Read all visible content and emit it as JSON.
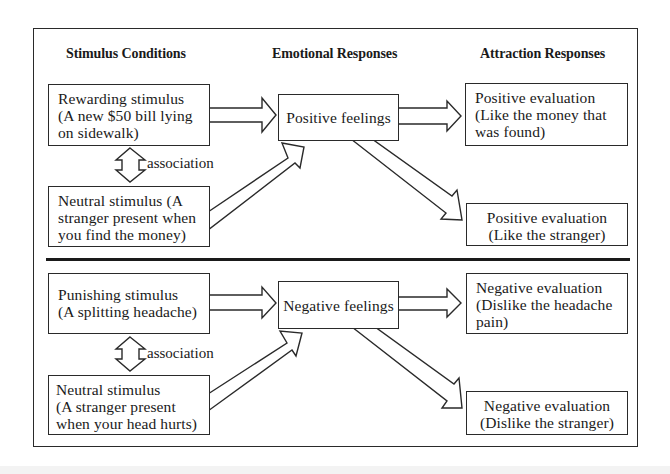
{
  "headers": {
    "stimulus": "Stimulus Conditions",
    "emotional": "Emotional Responses",
    "attraction": "Attraction Responses"
  },
  "positive_panel": {
    "stimulus_box": "Rewarding stimulus\n(A new $50 bill lying\non sidewalk)",
    "association_label": "association",
    "neutral_box": "Neutral stimulus  (A\nstranger present when\nyou find the money)",
    "feeling_box": "Positive feelings",
    "evaluation_stimulus_box": "Positive evaluation\n(Like the money that\nwas found)",
    "evaluation_stranger_box": "Positive evaluation\n(Like the stranger)"
  },
  "negative_panel": {
    "stimulus_box": "Punishing stimulus\n(A splitting headache)",
    "association_label": "association",
    "neutral_box": "Neutral stimulus\n(A stranger present\nwhen your head hurts)",
    "feeling_box": "Negative feelings",
    "evaluation_stimulus_box": "Negative evaluation\n(Dislike the headache\npain)",
    "evaluation_stranger_box": "Negative evaluation\n(Dislike the stranger)"
  },
  "icons": {
    "right_arrow": "block-arrow-right",
    "diagonal_up_arrow": "block-arrow-up-right",
    "diagonal_down_arrow": "block-arrow-down-right",
    "association_arrow": "double-headed-vertical-arrow"
  },
  "colors": {
    "line": "#2a2a2a",
    "text": "#1a1a1a",
    "background": "#ffffff"
  }
}
